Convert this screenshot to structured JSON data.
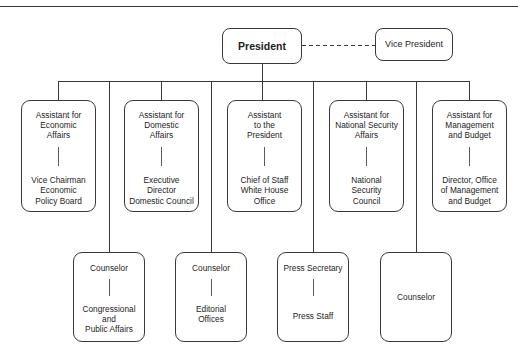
{
  "diagram": {
    "type": "organization-chart",
    "colors": {
      "box_border": "#3a3a3a",
      "connector": "#3a3a3a",
      "background": "#ffffff",
      "text": "#1d1d1d"
    },
    "top": {
      "president": {
        "label": "President"
      },
      "vice_president": {
        "label": "Vice President"
      },
      "connector_style": "dashed"
    },
    "row1": [
      {
        "title": "Assistant for\nEconomic\nAffairs",
        "sub": "Vice Chairman\nEconomic\nPolicy Board"
      },
      {
        "title": "Assistant for\nDomestic\nAffairs",
        "sub": "Executive\nDirector\nDomestic Council"
      },
      {
        "title": "Assistant\nto the\nPresident",
        "sub": "Chief of Staff\nWhite House\nOffice"
      },
      {
        "title": "Assistant for\nNational Security\nAffairs",
        "sub": "National\nSecurity\nCouncil"
      },
      {
        "title": "Assistant for\nManagement\nand Budget",
        "sub": "Director, Office\nof Management\nand Budget"
      }
    ],
    "row2": [
      {
        "title": "Counselor",
        "sub": "Congressional\nand\nPublic Affairs"
      },
      {
        "title": "Counselor",
        "sub": "Editorial\nOffices"
      },
      {
        "title": "Press Secretary",
        "sub": "Press Staff"
      },
      {
        "title": "Counselor",
        "sub": ""
      }
    ]
  }
}
